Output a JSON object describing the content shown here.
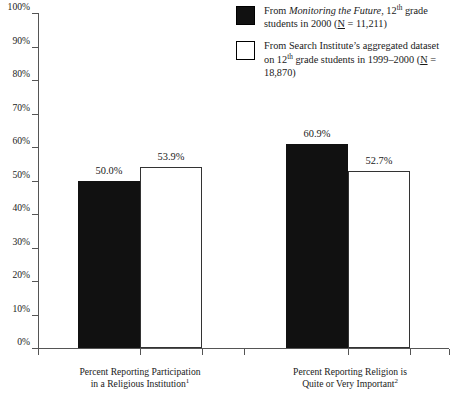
{
  "chart_data": {
    "type": "bar",
    "title": "",
    "subtitle": "",
    "xlabel": "",
    "ylabel": "",
    "ylim": [
      0,
      100
    ],
    "ytick_labels": [
      "100%",
      "90%",
      "80%",
      "70%",
      "60%",
      "50%",
      "40%",
      "30%",
      "20%",
      "10%",
      "0%"
    ],
    "ytick_values": [
      100,
      90,
      80,
      70,
      60,
      50,
      40,
      30,
      20,
      10,
      0
    ],
    "grid": false,
    "legend_position": "top-right",
    "categories": [
      "Percent Reporting Participation in a Religious Institution",
      "Percent Reporting Religion is Quite or Very Important"
    ],
    "category_footnotes": [
      "1",
      "2"
    ],
    "series": [
      {
        "name": "From Monitoring the Future, 12th grade students in 2000 (N = 11,211)",
        "style": "filled-black",
        "values": [
          50.0,
          60.9
        ],
        "value_labels": [
          "50.0%",
          "60.9%"
        ]
      },
      {
        "name": "From Search Institute's aggregated dataset on 12th grade students in 1999-2000 (N = 18,870)",
        "style": "open-white",
        "values": [
          53.9,
          52.7
        ],
        "value_labels": [
          "53.9%",
          "52.7%"
        ]
      }
    ]
  },
  "legend": {
    "items": [
      {
        "swatch": "filled",
        "line1_pre": "From ",
        "line1_italic": "Monitoring the Future",
        "line1_post": ", 12",
        "line1_sup": "th",
        "line1_tail": " grade",
        "line2_pre": "students in 2000 (",
        "line2_underline": "N",
        "line2_post": " = 11,211)"
      },
      {
        "swatch": "open",
        "line1": "From Search Institute’s aggregated dataset",
        "line2_pre": "on 12",
        "line2_sup": "th",
        "line2_mid": " grade students in 1999–2000 (",
        "line2_underline": "N",
        "line2_post": " =",
        "line3": "18,870)"
      }
    ]
  },
  "axis": {
    "y_labels": [
      "100%",
      "90%",
      "80%",
      "70%",
      "60%",
      "50%",
      "40%",
      "30%",
      "20%",
      "10%",
      "0%"
    ]
  },
  "categories": [
    {
      "line1": "Percent Reporting Participation",
      "line2": "in a Religious Institution",
      "footnote": "1"
    },
    {
      "line1": "Percent Reporting Religion is",
      "line2": "Quite or Very Important",
      "footnote": "2"
    }
  ],
  "bars": [
    {
      "group": 0,
      "series": 0,
      "label": "50.0%"
    },
    {
      "group": 0,
      "series": 1,
      "label": "53.9%"
    },
    {
      "group": 1,
      "series": 0,
      "label": "60.9%"
    },
    {
      "group": 1,
      "series": 1,
      "label": "52.7%"
    }
  ],
  "colors": {
    "filled": "#111111",
    "open": "#ffffff",
    "axis": "#555555",
    "text": "#1a1a1a",
    "background": "#ffffff"
  }
}
